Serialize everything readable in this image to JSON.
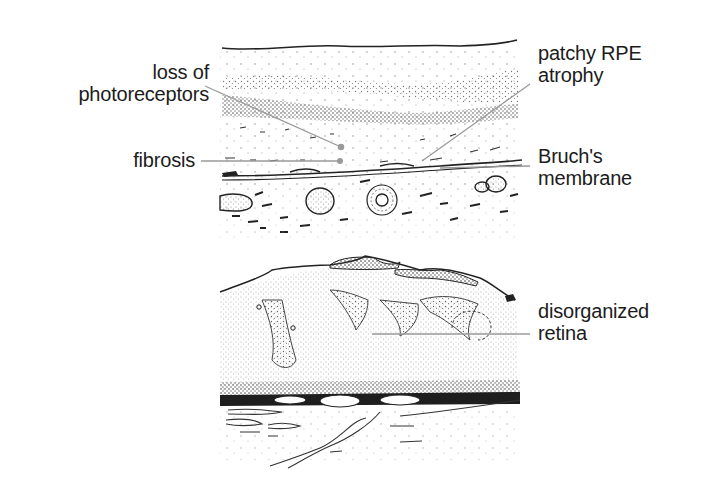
{
  "figure": {
    "panels": [
      {
        "id": "top",
        "description": "retinal cross-section showing atrophic changes",
        "labels": [
          {
            "key": "loss_of_photoreceptors",
            "lines": [
              "loss of",
              "photoreceptors"
            ]
          },
          {
            "key": "fibrosis",
            "lines": [
              "fibrosis"
            ]
          },
          {
            "key": "patchy_rpe_atrophy",
            "lines": [
              "patchy RPE",
              "atrophy"
            ]
          },
          {
            "key": "bruchs_membrane",
            "lines": [
              "Bruch's",
              "membrane"
            ]
          }
        ]
      },
      {
        "id": "bottom",
        "description": "retinal cross-section showing disorganized structure",
        "labels": [
          {
            "key": "disorganized_retina",
            "lines": [
              "disorganized",
              "retina"
            ]
          }
        ]
      }
    ],
    "colors": {
      "ink": "#1c1c1c",
      "leader_line": "#9a9a9a",
      "stipple": "#555555",
      "background": "#ffffff"
    }
  }
}
